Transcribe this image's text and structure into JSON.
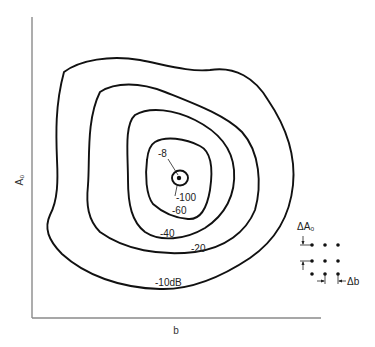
{
  "figure": {
    "axes": {
      "x_label": "b",
      "y_label": "A₀"
    },
    "contours": [
      {
        "level": -10,
        "label": "-10dB"
      },
      {
        "level": -20,
        "label": "-20"
      },
      {
        "level": -40,
        "label": "-40"
      },
      {
        "level": -60,
        "label": "-60"
      },
      {
        "level": -100,
        "label": "-100"
      }
    ],
    "peak_label": "-8",
    "grid_inset": {
      "delta_a_label": "ΔA₀",
      "delta_b_label": "Δb",
      "rows": 3,
      "cols": 3
    }
  }
}
